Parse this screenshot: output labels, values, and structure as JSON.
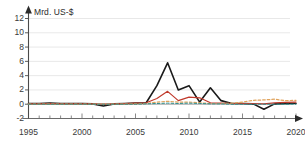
{
  "figure": {
    "cropped_top_text": "",
    "background_color": "#ffffff"
  },
  "axis": {
    "unit_label": "Mrd. US-$",
    "y_ticks": [
      "12",
      "10",
      "8",
      "6",
      "4",
      "2",
      "0",
      "-2"
    ],
    "x_ticks": [
      "1995",
      "2000",
      "2005",
      "2010",
      "2015",
      "2020"
    ],
    "arrow_x_name": "x-axis-arrow",
    "arrow_y_name": "y-axis-arrow"
  },
  "chart_data": {
    "type": "line",
    "title": "",
    "subtitle": "",
    "xlabel": "",
    "ylabel": "Mrd. US-$",
    "xlim": [
      1995,
      2020
    ],
    "ylim": [
      -2,
      12
    ],
    "y_ticks": [
      -2,
      0,
      2,
      4,
      6,
      8,
      10,
      12
    ],
    "x_ticks": [
      1995,
      2000,
      2005,
      2010,
      2015,
      2020
    ],
    "x_minor_tick_step": 1,
    "grid": "horizontal",
    "legend": "none",
    "x": [
      1995,
      1996,
      1997,
      1998,
      1999,
      2000,
      2001,
      2002,
      2003,
      2004,
      2005,
      2006,
      2007,
      2008,
      2009,
      2010,
      2011,
      2012,
      2013,
      2014,
      2015,
      2016,
      2017,
      2018,
      2019,
      2020
    ],
    "series": [
      {
        "name": "series-black",
        "color": "#1a1a1a",
        "style": "solid",
        "width": 1.6,
        "values": [
          0.1,
          0.1,
          0.15,
          0.1,
          0.1,
          0.1,
          0.05,
          -0.25,
          0.05,
          0.1,
          0.15,
          0.2,
          2.6,
          5.8,
          2.0,
          2.6,
          0.3,
          2.3,
          0.5,
          0.1,
          0.1,
          0.05,
          -0.7,
          0.05,
          0.1,
          0.1
        ]
      },
      {
        "name": "series-red",
        "color": "#c0392b",
        "style": "solid",
        "width": 1.2,
        "values": [
          0.05,
          0.05,
          0.1,
          0.05,
          0.05,
          0.05,
          0.05,
          0.0,
          0.05,
          0.1,
          0.15,
          0.2,
          0.8,
          1.8,
          0.5,
          1.0,
          0.9,
          0.2,
          0.15,
          0.1,
          0.1,
          0.1,
          0.05,
          0.2,
          0.25,
          0.3
        ]
      },
      {
        "name": "series-orange-dashed",
        "color": "#e0a35c",
        "style": "dashed",
        "width": 1.2,
        "values": [
          0.0,
          0.0,
          0.0,
          0.0,
          0.0,
          0.0,
          0.0,
          0.0,
          0.0,
          0.0,
          0.05,
          0.1,
          0.3,
          0.4,
          0.3,
          0.3,
          0.2,
          0.1,
          0.1,
          0.15,
          0.3,
          0.55,
          0.6,
          0.7,
          0.5,
          0.55
        ]
      },
      {
        "name": "series-teal-dashed",
        "color": "#2e8f8f",
        "style": "dashed",
        "width": 1.0,
        "values": [
          0.0,
          0.0,
          0.0,
          0.0,
          0.0,
          0.0,
          0.0,
          0.0,
          0.0,
          0.0,
          0.0,
          0.05,
          0.1,
          0.15,
          0.1,
          0.15,
          0.1,
          0.05,
          0.05,
          0.0,
          0.0,
          0.0,
          0.0,
          0.0,
          0.0,
          0.0
        ]
      }
    ]
  }
}
